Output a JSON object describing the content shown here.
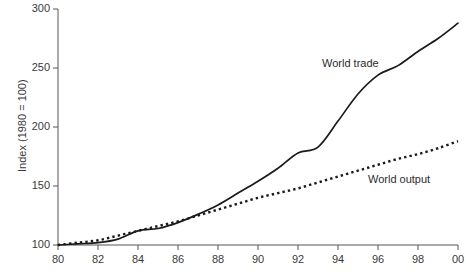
{
  "chart_data": {
    "type": "line",
    "title": "",
    "xlabel": "",
    "ylabel": "Index (1980 = 100)",
    "xlim": [
      1980,
      2000
    ],
    "ylim": [
      100,
      300
    ],
    "grid": false,
    "legend_position": "inline-annotation",
    "y_ticks": [
      100,
      150,
      200,
      250,
      300
    ],
    "y_tick_labels": [
      "100",
      "150",
      "200",
      "250",
      "300"
    ],
    "x_ticks": [
      1980,
      1982,
      1984,
      1986,
      1988,
      1990,
      1992,
      1994,
      1996,
      1998,
      2000
    ],
    "x_tick_labels": [
      "80",
      "82",
      "84",
      "86",
      "88",
      "90",
      "92",
      "94",
      "96",
      "98",
      "00"
    ],
    "x": [
      1980,
      1981,
      1982,
      1983,
      1984,
      1985,
      1986,
      1987,
      1988,
      1989,
      1990,
      1991,
      1992,
      1993,
      1994,
      1995,
      1996,
      1997,
      1998,
      1999,
      2000
    ],
    "series": [
      {
        "name": "World trade",
        "style": "solid",
        "color": "#1a1a1a",
        "values": [
          100,
          101,
          102,
          105,
          112,
          114,
          119,
          126,
          134,
          144,
          154,
          165,
          178,
          183,
          205,
          228,
          244,
          252,
          264,
          275,
          288
        ]
      },
      {
        "name": "World output",
        "style": "dotted",
        "color": "#1a1a1a",
        "values": [
          100,
          102,
          104,
          108,
          112,
          116,
          120,
          125,
          130,
          135,
          140,
          144,
          148,
          153,
          158,
          163,
          168,
          173,
          177,
          182,
          188
        ]
      }
    ],
    "annotations": [
      {
        "text": "World trade",
        "x": 1993.2,
        "y": 253
      },
      {
        "text": "World output",
        "x": 1995.5,
        "y": 155
      }
    ]
  },
  "axis": {
    "y_title": "Index (1980 = 100)"
  }
}
